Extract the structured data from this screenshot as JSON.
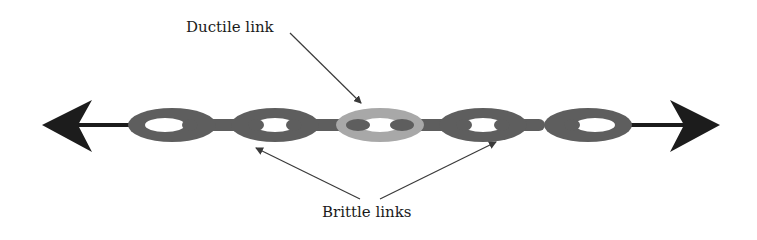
{
  "diagram": {
    "labels": {
      "ductile": "Ductile link",
      "brittle": "Brittle links"
    },
    "colors": {
      "brittle_link": "#5e5e5e",
      "ductile_link": "#a8a8a8",
      "arrow": "#1c1c1c",
      "pointer": "#3a3a3a",
      "background": "#ffffff"
    },
    "links": [
      {
        "id": 1,
        "type": "brittle",
        "cx": 172
      },
      {
        "id": 2,
        "type": "brittle",
        "cx": 275
      },
      {
        "id": 3,
        "type": "ductile",
        "cx": 380
      },
      {
        "id": 4,
        "type": "brittle",
        "cx": 483
      },
      {
        "id": 5,
        "type": "brittle",
        "cx": 588
      }
    ]
  }
}
